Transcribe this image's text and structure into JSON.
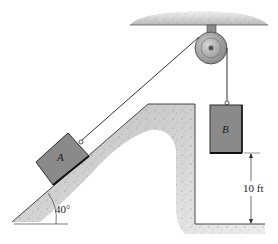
{
  "diagram": {
    "type": "pulley-incline-system",
    "blocks": [
      {
        "id": "A",
        "label": "A",
        "position": "on incline"
      },
      {
        "id": "B",
        "label": "B",
        "position": "hanging"
      }
    ],
    "incline_angle_label": "40°",
    "height_dimension_label": "10 ft",
    "colors": {
      "block_fill": "#8a8a8a",
      "block_edge": "#2a2a2a",
      "ground_fill": "#c8c8c8",
      "rope": "#333333",
      "pulley": "#9a9a9a"
    }
  }
}
